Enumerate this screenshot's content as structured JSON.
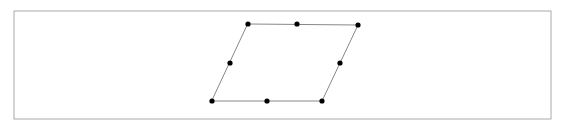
{
  "figure": {
    "canvas": {
      "width": 566,
      "height": 131,
      "background": "#ffffff"
    },
    "frame": {
      "x": 14,
      "y": 11,
      "width": 537,
      "height": 108,
      "stroke": "#aaaaaa",
      "stroke_width": 1,
      "fill": "#ffffff"
    },
    "shape": {
      "type": "parallelogram",
      "stroke": "#888888",
      "stroke_width": 1,
      "points_attr": "248,24 358,25 322,101 212,101",
      "vertices": [
        {
          "name": "top-left",
          "x": 248,
          "y": 24
        },
        {
          "name": "top-right",
          "x": 358,
          "y": 25
        },
        {
          "name": "bottom-right",
          "x": 322,
          "y": 101
        },
        {
          "name": "bottom-left",
          "x": 212,
          "y": 101
        }
      ],
      "midpoints": [
        {
          "name": "top-edge-midpoint",
          "x": 297,
          "y": 24
        },
        {
          "name": "right-edge-midpoint",
          "x": 340,
          "y": 63
        },
        {
          "name": "bottom-edge-midpoint",
          "x": 267,
          "y": 101
        },
        {
          "name": "left-edge-midpoint",
          "x": 230,
          "y": 63
        }
      ],
      "dot": {
        "radius": 2.6,
        "fill": "#000000"
      }
    }
  }
}
